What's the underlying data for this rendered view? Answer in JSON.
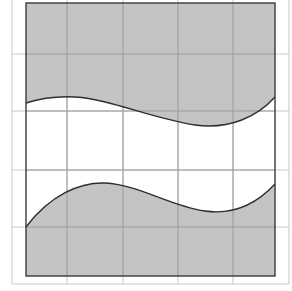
{
  "diagram": {
    "title": "",
    "colors": {
      "background": "#ffffff",
      "shade": "#c4c4c4",
      "grid_line": "#9a9a9a",
      "outer_frame": "#c8c8c8",
      "border": "#3a3a3a",
      "curve": "#2e2e2e"
    },
    "outer_frame": {
      "x1": 12,
      "y1": -2,
      "x2": 289,
      "y2": 284
    },
    "shape": {
      "x1": 26,
      "y1": 3,
      "x2": 275,
      "y2": 276
    },
    "grid": {
      "vertical_lines": [
        12,
        67,
        123,
        178,
        233,
        289
      ],
      "horizontal_lines": [
        54,
        111,
        170,
        227,
        284
      ]
    },
    "upper_curve": {
      "path": "M26,103 C45,97 60,96 75,97 C110,99 150,118 195,125 C230,130 258,116 275,97"
    },
    "lower_curve": {
      "path": "M26,227 C50,195 80,182 105,183 C140,185 170,206 205,211 C240,216 262,198 275,184"
    }
  }
}
